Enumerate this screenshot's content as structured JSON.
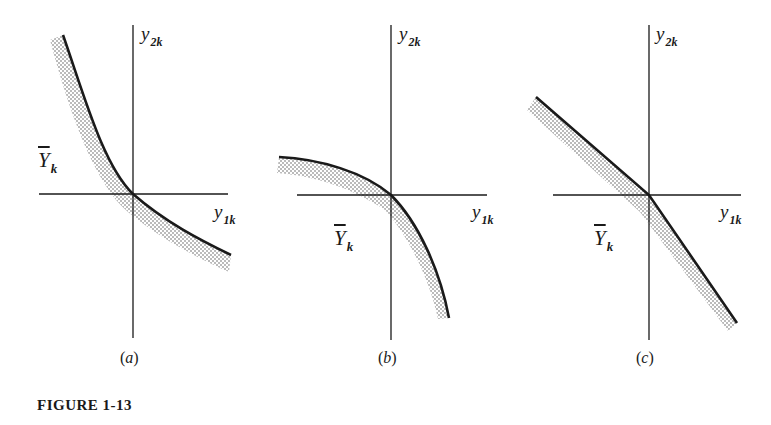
{
  "figure": {
    "caption": "FIGURE 1-13",
    "ink_color": "#1a1a1a",
    "shading_color": "#555555"
  },
  "panels": [
    {
      "id": "a",
      "label_open": "(",
      "label_letter": "a",
      "label_close": ")",
      "y_axis_label": "y",
      "y_axis_sub": "2k",
      "x_axis_label": "y",
      "x_axis_sub": "1k",
      "set_label": "Y",
      "set_sub": "k",
      "boundary_shape": "convex toward origin (hyperbola-like), decreasing",
      "shaded_side": "below-left of boundary"
    },
    {
      "id": "b",
      "label_open": "(",
      "label_letter": "b",
      "label_close": ")",
      "y_axis_label": "y",
      "y_axis_sub": "2k",
      "x_axis_label": "y",
      "x_axis_sub": "1k",
      "set_label": "Y",
      "set_sub": "k",
      "boundary_shape": "concave (bowed outward), decreasing",
      "shaded_side": "below-left of boundary"
    },
    {
      "id": "c",
      "label_open": "(",
      "label_letter": "c",
      "label_close": ")",
      "y_axis_label": "y",
      "y_axis_sub": "2k",
      "x_axis_label": "y",
      "x_axis_sub": "1k",
      "set_label": "Y",
      "set_sub": "k",
      "boundary_shape": "piecewise linear with kink at origin (two straight segments)",
      "shaded_side": "below-left of boundary"
    }
  ]
}
